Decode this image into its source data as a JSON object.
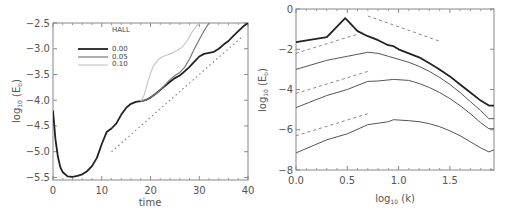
{
  "chart_data": [
    {
      "type": "line",
      "xlabel": "time",
      "ylabel": "log10 (E_b)",
      "ylabel_main": "log",
      "ylabel_sub": "10",
      "ylabel_rest": " (E",
      "ylabel_rest_sub": "b",
      "ylabel_close": ")",
      "xlim": [
        0,
        40
      ],
      "ylim": [
        -5.55,
        -2.5
      ],
      "xticks": [
        0,
        10,
        20,
        30,
        40
      ],
      "xtick_labels": [
        "0",
        "10",
        "20",
        "30",
        "40"
      ],
      "yticks": [
        -5.5,
        -5.0,
        -4.5,
        -4.0,
        -3.5,
        -3.0,
        -2.5
      ],
      "ytick_labels": [
        "−5.5",
        "−5.0",
        "−4.5",
        "−4.0",
        "−3.5",
        "−3.0",
        "−2.5"
      ],
      "legend": {
        "title": "HALL",
        "entries": [
          "0.00",
          "0.05",
          "0.10"
        ]
      },
      "grid": false,
      "series": [
        {
          "name": "0.00",
          "color": "#222222",
          "width": 1.8,
          "x": [
            0,
            0.5,
            1,
            1.5,
            2,
            3,
            4,
            5,
            6,
            7,
            8,
            9,
            10,
            11,
            12,
            13,
            14,
            15,
            16,
            17,
            18,
            19,
            20,
            21,
            22,
            23,
            24,
            25,
            26,
            27,
            28,
            29,
            30,
            31,
            32,
            33,
            34,
            35,
            36,
            37,
            38,
            39,
            40
          ],
          "y": [
            -4.2,
            -4.75,
            -5.1,
            -5.3,
            -5.4,
            -5.48,
            -5.49,
            -5.47,
            -5.44,
            -5.38,
            -5.28,
            -5.12,
            -4.85,
            -4.62,
            -4.55,
            -4.45,
            -4.28,
            -4.15,
            -4.07,
            -4.03,
            -4.02,
            -4.0,
            -3.95,
            -3.88,
            -3.8,
            -3.72,
            -3.64,
            -3.57,
            -3.52,
            -3.44,
            -3.35,
            -3.25,
            -3.15,
            -3.1,
            -3.08,
            -3.06,
            -3.0,
            -2.92,
            -2.85,
            -2.75,
            -2.66,
            -2.57,
            -2.5
          ]
        },
        {
          "name": "0.05",
          "color": "#777777",
          "width": 1.2,
          "x": [
            18,
            19,
            20,
            21,
            22,
            23,
            24,
            25,
            26,
            27,
            28,
            29,
            30,
            31,
            32
          ],
          "y": [
            -4.02,
            -4.0,
            -3.95,
            -3.88,
            -3.8,
            -3.7,
            -3.6,
            -3.52,
            -3.46,
            -3.36,
            -3.2,
            -3.0,
            -2.82,
            -2.65,
            -2.5
          ]
        },
        {
          "name": "0.10",
          "color": "#c8c8c8",
          "width": 1.2,
          "x": [
            18,
            18.7,
            19.5,
            20.5,
            21.5,
            22.5,
            23.5,
            24.5,
            25.5,
            26.5,
            27.5,
            28.5,
            29.5,
            30
          ],
          "y": [
            -4.02,
            -3.9,
            -3.62,
            -3.35,
            -3.22,
            -3.15,
            -3.12,
            -3.08,
            -3.03,
            -2.97,
            -2.85,
            -2.68,
            -2.55,
            -2.5
          ]
        },
        {
          "name": "reference",
          "style": "dotted",
          "color": "#888888",
          "x": [
            12,
            39
          ],
          "y": [
            -5.0,
            -2.75
          ]
        }
      ]
    },
    {
      "type": "line",
      "xlabel": "log10 (k)",
      "xlabel_main": "log",
      "xlabel_sub": "10",
      "xlabel_rest": " (k)",
      "ylabel": "log10 (E_b)",
      "ylabel_main": "log",
      "ylabel_sub": "10",
      "ylabel_rest": " (E",
      "ylabel_rest_sub": "b",
      "ylabel_close": ")",
      "xlim": [
        0,
        1.93
      ],
      "ylim": [
        -8,
        0
      ],
      "xticks": [
        0.0,
        0.5,
        1.0,
        1.5
      ],
      "xtick_labels": [
        "0.0",
        "0.5",
        "1.0",
        "1.5"
      ],
      "yticks": [
        0,
        -2,
        -4,
        -6,
        -8
      ],
      "ytick_labels": [
        "0",
        "−2",
        "−4",
        "−6",
        "−8"
      ],
      "grid": false,
      "series": [
        {
          "name": "spectrum-1",
          "color": "#222222",
          "width": 1.8,
          "x": [
            0,
            0.3,
            0.48,
            0.6,
            0.7,
            0.8,
            0.9,
            0.95,
            1.0,
            1.1,
            1.2,
            1.3,
            1.4,
            1.5,
            1.6,
            1.7,
            1.8,
            1.88,
            1.93
          ],
          "y": [
            -1.65,
            -1.4,
            -0.45,
            -1.1,
            -1.35,
            -1.55,
            -1.8,
            -1.85,
            -2.0,
            -2.2,
            -2.4,
            -2.7,
            -3.0,
            -3.35,
            -3.75,
            -4.15,
            -4.55,
            -4.8,
            -4.8
          ]
        },
        {
          "name": "spectrum-2",
          "color": "#555555",
          "width": 1.0,
          "x": [
            0,
            0.3,
            0.5,
            0.7,
            0.8,
            0.9,
            1.0,
            1.1,
            1.2,
            1.3,
            1.4,
            1.5,
            1.6,
            1.7,
            1.8,
            1.88,
            1.93
          ],
          "y": [
            -3.0,
            -2.55,
            -2.35,
            -2.15,
            -2.2,
            -2.35,
            -2.5,
            -2.65,
            -2.85,
            -3.1,
            -3.4,
            -3.75,
            -4.15,
            -4.6,
            -5.05,
            -5.45,
            -5.45
          ]
        },
        {
          "name": "spectrum-3",
          "color": "#555555",
          "width": 1.0,
          "x": [
            0,
            0.3,
            0.5,
            0.7,
            0.8,
            0.95,
            1.1,
            1.2,
            1.3,
            1.4,
            1.5,
            1.6,
            1.7,
            1.8,
            1.88,
            1.93
          ],
          "y": [
            -4.9,
            -4.3,
            -4.0,
            -3.6,
            -3.58,
            -3.5,
            -3.55,
            -3.7,
            -3.9,
            -4.15,
            -4.45,
            -4.8,
            -5.2,
            -5.65,
            -5.95,
            -5.95
          ]
        },
        {
          "name": "spectrum-4",
          "color": "#555555",
          "width": 1.0,
          "x": [
            0,
            0.3,
            0.5,
            0.7,
            0.9,
            0.95,
            1.1,
            1.2,
            1.3,
            1.4,
            1.5,
            1.6,
            1.7,
            1.8,
            1.88,
            1.93
          ],
          "y": [
            -7.15,
            -6.5,
            -6.2,
            -5.75,
            -5.6,
            -5.5,
            -5.55,
            -5.6,
            -5.7,
            -5.85,
            -6.05,
            -6.3,
            -6.6,
            -6.9,
            -7.1,
            -7.0
          ]
        },
        {
          "name": "ref-slope-upper",
          "style": "dashed",
          "color": "#888888",
          "x": [
            0.7,
            1.4
          ],
          "y": [
            -0.35,
            -1.6
          ]
        },
        {
          "name": "ref-slope-1",
          "style": "dashed",
          "color": "#888888",
          "x": [
            0.0,
            0.6
          ],
          "y": [
            -2.2,
            -1.25
          ]
        },
        {
          "name": "ref-slope-2",
          "style": "dashed",
          "color": "#888888",
          "x": [
            0.0,
            0.7
          ],
          "y": [
            -4.2,
            -3.1
          ]
        },
        {
          "name": "ref-slope-3",
          "style": "dashed",
          "color": "#888888",
          "x": [
            0.0,
            0.7
          ],
          "y": [
            -6.3,
            -5.2
          ]
        }
      ]
    }
  ]
}
